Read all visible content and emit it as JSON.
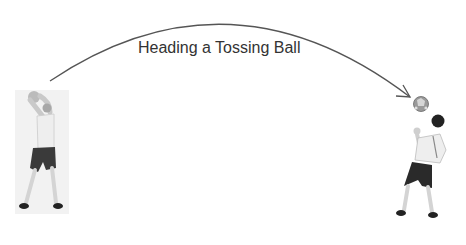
{
  "diagram": {
    "title": "Heading a Tossing Ball",
    "elements": [
      {
        "name": "tossing-player",
        "description": "player holding ball overhead with both hands, throwing"
      },
      {
        "name": "trajectory-arrow",
        "description": "curved arc arrow from thrower to ball"
      },
      {
        "name": "soccer-ball",
        "description": "ball in the air in front of receiving player"
      },
      {
        "name": "heading-player",
        "description": "player leaning back, preparing to head the ball"
      }
    ],
    "colors": {
      "arrow": "#555555",
      "text": "#333333",
      "shorts": "#2a2a2a",
      "shirt": "#e8e8e8"
    }
  }
}
